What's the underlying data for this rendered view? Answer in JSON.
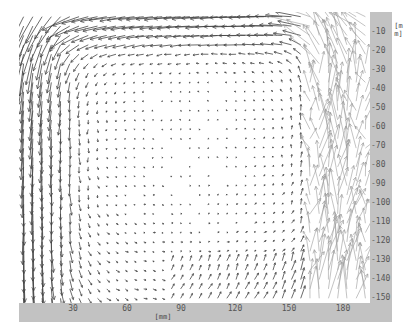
{
  "chart_data": {
    "type": "quiver",
    "title": "",
    "xlabel": "[mm]",
    "ylabel": "[mm]",
    "x_ticks": [
      30,
      60,
      90,
      120,
      150,
      180
    ],
    "y_ticks": [
      10,
      20,
      30,
      40,
      50,
      60,
      70,
      80,
      90,
      100,
      110,
      120,
      130,
      140,
      150
    ],
    "xlim": [
      0,
      195
    ],
    "ylim": [
      0,
      155
    ],
    "y_axis_inverted": true,
    "grid": false,
    "legend": null,
    "vector_grid": {
      "nx": 38,
      "ny": 31,
      "spacing_mm": 5
    },
    "flow_regions": [
      {
        "region": "left wall (x 0-40 mm)",
        "direction": "down",
        "magnitude": "high"
      },
      {
        "region": "top (y 0-20 mm, x 30-160 mm)",
        "direction": "left",
        "magnitude": "high"
      },
      {
        "region": "upper-left corner",
        "direction": "down-left",
        "magnitude": "high"
      },
      {
        "region": "center (x 60-140, y 40-150)",
        "direction": "swirl",
        "magnitude": "low"
      },
      {
        "region": "right (x 140-165 mm)",
        "direction": "up",
        "magnitude": "medium"
      },
      {
        "region": "right wall (x 165-195 mm)",
        "direction": "up/turbulent",
        "magnitude": "very high, noisy"
      },
      {
        "region": "bottom (y 135-155, x 85-165)",
        "direction": "up",
        "magnitude": "low-medium"
      }
    ],
    "vortex_center_mm": [
      95,
      60
    ]
  },
  "colors": {
    "axis_band": "#c2c2c2",
    "arrow_dark": "#444444",
    "arrow_light": "#9a9a9a",
    "background": "#ffffff"
  },
  "axes": {
    "x_unit": "[mm]",
    "y_unit": "[mm]",
    "x_tick_labels": [
      "30",
      "60",
      "90",
      "120",
      "150",
      "180"
    ],
    "y_tick_labels": [
      "10",
      "20",
      "30",
      "40",
      "50",
      "60",
      "70",
      "80",
      "90",
      "100",
      "110",
      "120",
      "130",
      "140",
      "150"
    ]
  }
}
